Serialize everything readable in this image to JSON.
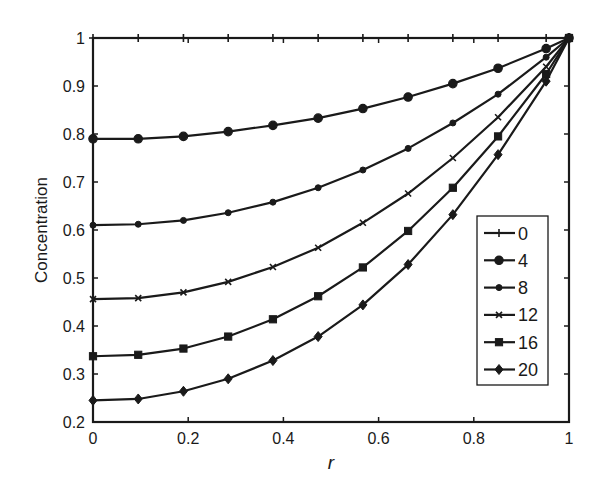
{
  "chart_data": {
    "type": "line",
    "title": "",
    "xlabel": "r",
    "ylabel": "Concentration",
    "xlim": [
      0,
      1
    ],
    "ylim": [
      0.2,
      1
    ],
    "grid": false,
    "legend_position": "inside-right",
    "x_ticks": [
      "0",
      "0.2",
      "0.4",
      "0.6",
      "0.8",
      "1"
    ],
    "y_ticks": [
      "0.2",
      "0.3",
      "0.4",
      "0.5",
      "0.6",
      "0.7",
      "0.8",
      "0.9",
      "1"
    ],
    "x": [
      0,
      0.095,
      0.19,
      0.284,
      0.378,
      0.473,
      0.567,
      0.662,
      0.756,
      0.851,
      0.952,
      1.0
    ],
    "series": [
      {
        "name": "0",
        "marker": "plus",
        "values": [
          1,
          1,
          1,
          1,
          1,
          1,
          1,
          1,
          1,
          1,
          1,
          1
        ]
      },
      {
        "name": "4",
        "marker": "circle",
        "values": [
          0.79,
          0.79,
          0.795,
          0.805,
          0.818,
          0.833,
          0.853,
          0.877,
          0.905,
          0.937,
          0.978,
          1.0
        ]
      },
      {
        "name": "8",
        "marker": "dot",
        "values": [
          0.61,
          0.612,
          0.62,
          0.636,
          0.658,
          0.688,
          0.725,
          0.77,
          0.823,
          0.883,
          0.96,
          1.0
        ]
      },
      {
        "name": "12",
        "marker": "x",
        "values": [
          0.456,
          0.458,
          0.47,
          0.492,
          0.523,
          0.563,
          0.615,
          0.676,
          0.75,
          0.835,
          0.94,
          1.0
        ]
      },
      {
        "name": "16",
        "marker": "square",
        "values": [
          0.337,
          0.34,
          0.353,
          0.378,
          0.414,
          0.462,
          0.522,
          0.598,
          0.688,
          0.795,
          0.925,
          1.0
        ]
      },
      {
        "name": "20",
        "marker": "diamond",
        "values": [
          0.245,
          0.248,
          0.264,
          0.29,
          0.328,
          0.378,
          0.444,
          0.528,
          0.632,
          0.757,
          0.91,
          1.0
        ]
      }
    ],
    "colors": {
      "line": "#1a1a1a",
      "background": "#ffffff"
    }
  }
}
